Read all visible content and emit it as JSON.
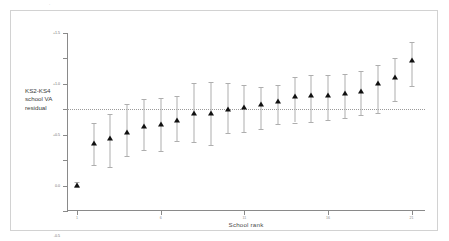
{
  "chart_data": {
    "type": "scatter",
    "title": "",
    "subtitle": "",
    "xlabel": "School rank",
    "ylabel": "KS2-KS4 school VA residual",
    "ylabel_lines": [
      "KS2-KS4",
      "school VA",
      "residual"
    ],
    "xlim": [
      0.4,
      21.8
    ],
    "ylim": [
      -2.0,
      1.5
    ],
    "grid": false,
    "legend": null,
    "reference_line": {
      "value": 0.0,
      "style": "dotted",
      "color": "#9a9a9a"
    },
    "error_bars": "95% confidence interval",
    "marker": "filled-triangle",
    "y_ticks": [
      1.5,
      1.0,
      0.5,
      0.0,
      -0.5,
      -1.0,
      -1.5,
      -2.0
    ],
    "y_tick_labels": [
      "+1.5",
      "+1.0",
      "+0.5",
      "0.0",
      "-0.5",
      "-1.0",
      "-1.5",
      "-2.0"
    ],
    "x_ticks": [
      1,
      6,
      11,
      16,
      21
    ],
    "x_tick_labels": [
      "1",
      "6",
      "11",
      "16",
      "21"
    ],
    "categories": [
      1,
      2,
      3,
      4,
      5,
      6,
      7,
      8,
      9,
      10,
      11,
      12,
      13,
      14,
      15,
      16,
      17,
      18,
      19,
      20,
      21
    ],
    "values": [
      -1.48,
      -0.66,
      -0.57,
      -0.44,
      -0.32,
      -0.29,
      -0.22,
      -0.07,
      -0.07,
      0.01,
      0.05,
      0.1,
      0.17,
      0.26,
      0.28,
      0.28,
      0.32,
      0.36,
      0.52,
      0.64,
      0.96
    ],
    "ci_lower": [
      -1.53,
      -1.09,
      -1.14,
      -0.91,
      -0.8,
      -0.82,
      -0.63,
      -0.65,
      -0.7,
      -0.47,
      -0.45,
      -0.38,
      -0.29,
      -0.26,
      -0.25,
      -0.21,
      -0.18,
      -0.12,
      -0.07,
      0.17,
      0.46
    ],
    "ci_upper": [
      -1.43,
      -0.27,
      -0.1,
      0.1,
      0.21,
      0.23,
      0.26,
      0.52,
      0.53,
      0.52,
      0.47,
      0.44,
      0.48,
      0.63,
      0.67,
      0.68,
      0.69,
      0.75,
      0.88,
      1.0,
      1.33
    ]
  },
  "annotations": {
    "top_artifact": "·"
  }
}
